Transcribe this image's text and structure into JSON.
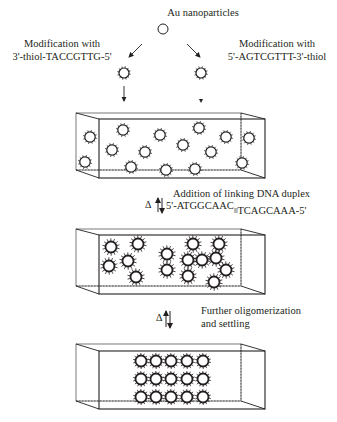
{
  "title": "Au nanoparticles",
  "left_modification": {
    "line1": "Modification with",
    "line2": "3'-thiol-TACCGTTG-5'"
  },
  "right_modification": {
    "line1": "Modification with",
    "line2": "5'-AGTCGTTT-3'-thiol"
  },
  "step1": {
    "delta": "Δ",
    "label": "Addition of linking DNA duplex",
    "duplex_left": "5'-ATGGCAAC",
    "duplex_link": "||||",
    "duplex_right": "TCAGCAAA-5'"
  },
  "step2": {
    "delta": "Δ",
    "line1": "Further oligomerization",
    "line2": "and settling"
  },
  "boxes": [
    {
      "name": "dispersed-particles",
      "particles": [
        [
          90,
          137
        ],
        [
          85,
          162
        ],
        [
          123,
          130
        ],
        [
          112,
          150
        ],
        [
          131,
          167
        ],
        [
          160,
          135
        ],
        [
          145,
          152
        ],
        [
          166,
          170
        ],
        [
          183,
          145
        ],
        [
          199,
          128
        ],
        [
          211,
          152
        ],
        [
          226,
          137
        ],
        [
          195,
          169
        ],
        [
          249,
          138
        ],
        [
          242,
          163
        ]
      ]
    },
    {
      "name": "aggregated-particles",
      "particles": [
        [
          111,
          247
        ],
        [
          138,
          244
        ],
        [
          109,
          266
        ],
        [
          128,
          261
        ],
        [
          136,
          277
        ],
        [
          167,
          254
        ],
        [
          167,
          270
        ],
        [
          193,
          244
        ],
        [
          219,
          244
        ],
        [
          188,
          260
        ],
        [
          202,
          260
        ],
        [
          216,
          258
        ],
        [
          226,
          270
        ],
        [
          188,
          276
        ],
        [
          214,
          282
        ]
      ]
    },
    {
      "name": "settled-lattice",
      "particles": [
        [
          141,
          361
        ],
        [
          156,
          361
        ],
        [
          171,
          361
        ],
        [
          187,
          361
        ],
        [
          203,
          361
        ],
        [
          141,
          379
        ],
        [
          156,
          379
        ],
        [
          171,
          379
        ],
        [
          187,
          379
        ],
        [
          203,
          379
        ],
        [
          141,
          397
        ],
        [
          156,
          397
        ],
        [
          171,
          397
        ],
        [
          187,
          397
        ],
        [
          203,
          397
        ]
      ]
    }
  ],
  "colors": {
    "ink": "#231f20",
    "background": "#ffffff"
  }
}
